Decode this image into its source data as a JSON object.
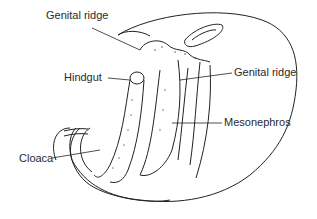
{
  "diagram": {
    "type": "anatomical illustration",
    "labels": [
      {
        "id": "genital-ridge-top",
        "text": "Genital ridge"
      },
      {
        "id": "hindgut",
        "text": "Hindgut"
      },
      {
        "id": "genital-ridge-right",
        "text": "Genital ridge"
      },
      {
        "id": "mesonephros",
        "text": "Mesonephros"
      },
      {
        "id": "cloaca",
        "text": "Cloaca"
      }
    ]
  }
}
